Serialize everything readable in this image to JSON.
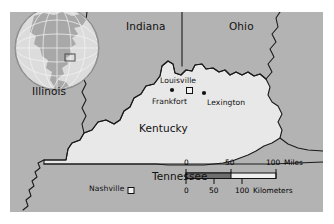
{
  "figure": {
    "kind": "reference-map",
    "subject": "Kentucky",
    "frame": {
      "x": 10,
      "y": 12,
      "width": 313,
      "height": 200
    },
    "colors": {
      "background": "#ffffff",
      "neighbor_land": "#b3b3b3",
      "subject_land": "#e8e8e8",
      "water": "#b3b3b3",
      "border_line": "#1a1a1a",
      "globe_ocean": "#dcdcdc",
      "globe_land": "#a8a8a8",
      "text": "#111111"
    }
  },
  "inset": {
    "name": "globe-locator-inset",
    "description": "globe showing North America with graticule",
    "center": {
      "x": 57,
      "y": 48
    },
    "radius": 42,
    "highlight_box": {
      "x": 66,
      "y": 55,
      "width": 10,
      "height": 7
    }
  },
  "states": [
    {
      "id": "indiana",
      "label": "Indiana",
      "x": 126,
      "y": 26,
      "type": "neighbor"
    },
    {
      "id": "ohio",
      "label": "Ohio",
      "x": 229,
      "y": 26,
      "type": "neighbor"
    },
    {
      "id": "illinois",
      "label": "Illinois",
      "x": 32,
      "y": 91,
      "type": "neighbor"
    },
    {
      "id": "kentucky",
      "label": "Kentucky",
      "x": 139,
      "y": 128,
      "type": "subject"
    },
    {
      "id": "tennessee",
      "label": "Tennessee",
      "x": 152,
      "y": 176,
      "type": "neighbor"
    }
  ],
  "cities": [
    {
      "id": "louisville",
      "label": "Louisville",
      "marker": "dot",
      "label_x": 160,
      "label_y": 76,
      "marker_x": 172,
      "marker_y": 88
    },
    {
      "id": "frankfort",
      "label": "Frankfort",
      "marker": "square",
      "label_x": 152,
      "label_y": 97,
      "marker_x": 189,
      "marker_y": 90,
      "is_capital": true
    },
    {
      "id": "lexington",
      "label": "Lexington",
      "marker": "dot",
      "label_x": 205,
      "label_y": 98,
      "marker_x": 204,
      "marker_y": 90
    },
    {
      "id": "nashville",
      "label": "Nashville",
      "marker": "square",
      "label_x": 89,
      "label_y": 190,
      "marker_x": 128,
      "marker_y": 191,
      "is_capital": true
    }
  ],
  "scalebar": {
    "name": "distance-scale-bar",
    "miles": {
      "unit_label": "Miles",
      "ticks": [
        "0",
        "50",
        "100"
      ],
      "tick_positions": [
        0,
        45,
        90
      ]
    },
    "kilometers": {
      "unit_label": "Kilometers",
      "ticks": [
        "0",
        "50",
        "100"
      ],
      "tick_positions": [
        0,
        28,
        56
      ]
    }
  }
}
